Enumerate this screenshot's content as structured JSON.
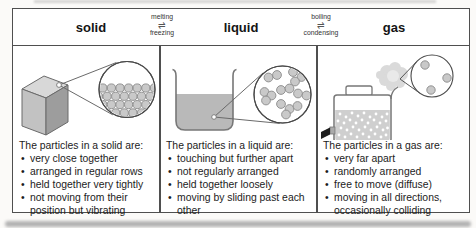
{
  "header": {
    "columns": [
      {
        "title": "solid"
      },
      {
        "title": "liquid"
      },
      {
        "title": "gas"
      }
    ],
    "transitions": [
      {
        "forward": "melting",
        "arrow": "⇌",
        "reverse": "freezing"
      },
      {
        "forward": "boiling",
        "arrow": "⇌",
        "reverse": "condensing"
      }
    ]
  },
  "columns": [
    {
      "title": "solid",
      "heading": "The particles in a solid are:",
      "bullets": [
        "very close together",
        "arranged in regular rows",
        "held together very tightly",
        "not moving from their position but vibrating"
      ]
    },
    {
      "title": "liquid",
      "heading": "The particles in a liquid are:",
      "bullets": [
        "touching but further apart",
        "not regularly arranged",
        "held together loosely",
        "moving by sliding past each other"
      ]
    },
    {
      "title": "gas",
      "heading": "The particles in a gas are:",
      "bullets": [
        "very far apart",
        "randomly arranged",
        "free to move (diffuse)",
        "moving in all directions, occasionally colliding"
      ]
    }
  ],
  "colors": {
    "table_border": "#4f4f4f",
    "particle_fill": "#c9c9c9",
    "particle_stroke": "#8a8a8a",
    "liquid_fill": "#b9b9b9",
    "cube_top": "#d8d8d8",
    "cube_front": "#c2c2c2",
    "cube_side": "#9d9d9d",
    "spray_cloud": "#dadada"
  }
}
